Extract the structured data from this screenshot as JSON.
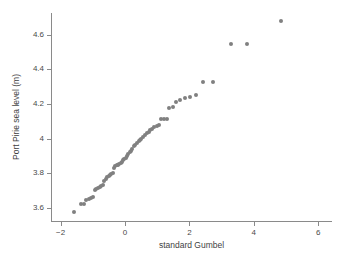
{
  "chart_data": {
    "type": "scatter",
    "title": "",
    "xlabel": "standard Gumbel",
    "ylabel": "Port Pirie sea level (m)",
    "xlim": [
      -2.3,
      6.4
    ],
    "ylim": [
      3.53,
      4.73
    ],
    "xticks": [
      -2,
      0,
      2,
      4,
      6
    ],
    "xtick_labels": [
      "−2",
      "0",
      "2",
      "4",
      "6"
    ],
    "yticks": [
      3.6,
      3.8,
      4.0,
      4.2,
      4.4,
      4.6
    ],
    "ytick_labels": [
      "3.6",
      "3.8",
      "4",
      "4.2",
      "4.4",
      "4.6"
    ],
    "grid": false,
    "legend": null,
    "marker": {
      "shape": "circle",
      "color": "#808080",
      "size_px": 4
    },
    "n_points": 65,
    "x": [
      -1.6,
      -1.36,
      -1.29,
      -1.2,
      -1.13,
      -1.06,
      -1.0,
      -0.94,
      -0.89,
      -0.84,
      -0.79,
      -0.74,
      -0.69,
      -0.64,
      -0.6,
      -0.55,
      -0.51,
      -0.47,
      -0.43,
      -0.38,
      -0.34,
      -0.3,
      -0.26,
      -0.22,
      -0.18,
      -0.14,
      -0.1,
      -0.06,
      -0.02,
      0.02,
      0.06,
      0.1,
      0.15,
      0.19,
      0.23,
      0.28,
      0.32,
      0.37,
      0.42,
      0.46,
      0.51,
      0.56,
      0.62,
      0.67,
      0.73,
      0.79,
      0.85,
      0.91,
      0.98,
      1.05,
      1.12,
      1.2,
      1.29,
      1.38,
      1.48,
      1.59,
      1.71,
      1.85,
      2.01,
      2.2,
      2.43,
      2.73,
      3.28,
      3.78,
      4.86
    ],
    "y": [
      3.575,
      3.62,
      3.625,
      3.645,
      3.65,
      3.655,
      3.66,
      3.705,
      3.71,
      3.715,
      3.72,
      3.725,
      3.73,
      3.755,
      3.765,
      3.78,
      3.785,
      3.79,
      3.795,
      3.8,
      3.83,
      3.84,
      3.845,
      3.85,
      3.855,
      3.86,
      3.865,
      3.875,
      3.88,
      3.89,
      3.9,
      3.91,
      3.925,
      3.93,
      3.94,
      3.955,
      3.96,
      3.975,
      3.985,
      3.99,
      4.0,
      4.01,
      4.02,
      4.03,
      4.04,
      4.05,
      4.055,
      4.065,
      4.075,
      4.08,
      4.11,
      4.11,
      4.11,
      4.175,
      4.18,
      4.21,
      4.225,
      4.235,
      4.24,
      4.25,
      4.325,
      4.325,
      4.545,
      4.545,
      4.68
    ]
  },
  "figure": {
    "background": "#ffffff",
    "axis_color": "#8a8a8a",
    "text_color": "#3f3f3f"
  }
}
